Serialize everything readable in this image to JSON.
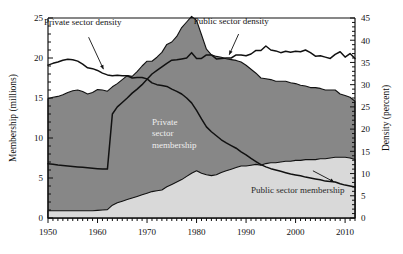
{
  "chart_data": {
    "type": "area",
    "title": "",
    "xlabel": "",
    "ylabel": "Membership (millions)",
    "y2label": "Density (percent)",
    "xlim": [
      1950,
      2012
    ],
    "ylim": [
      0,
      25
    ],
    "y2lim": [
      0,
      45
    ],
    "grid": false,
    "legend_position": "inline-annotations",
    "x_ticks": [
      1950,
      1960,
      1970,
      1980,
      1990,
      2000,
      2010
    ],
    "y_ticks": [
      0,
      5,
      10,
      15,
      20,
      25
    ],
    "y2_ticks": [
      0,
      5,
      10,
      15,
      20,
      25,
      30,
      35,
      40,
      45
    ],
    "x_minor_tick_step": 1,
    "y_minor_tick_step": 1,
    "annotations": [
      {
        "name": "private-sector-density-label",
        "text": "Private sector density",
        "x": 1957,
        "y": 24.1
      },
      {
        "name": "public-sector-density-label",
        "text": "Public sector density",
        "x": 1987,
        "y": 24.3
      },
      {
        "name": "private-sector-membership-label",
        "text": "Private",
        "x": 1971,
        "y": 11.6
      },
      {
        "name": "private-sector-membership-label-2",
        "text": "sector",
        "x": 1971,
        "y": 10.2
      },
      {
        "name": "private-sector-membership-label-3",
        "text": "membership",
        "x": 1971,
        "y": 8.8
      },
      {
        "name": "public-sector-membership-label",
        "text": "Public sector membership",
        "x": 1991,
        "y": 3.1
      }
    ],
    "x": [
      1950,
      1951,
      1952,
      1953,
      1954,
      1955,
      1956,
      1957,
      1958,
      1959,
      1960,
      1961,
      1962,
      1963,
      1964,
      1965,
      1966,
      1967,
      1968,
      1969,
      1970,
      1971,
      1972,
      1973,
      1974,
      1975,
      1976,
      1977,
      1978,
      1979,
      1980,
      1981,
      1982,
      1983,
      1984,
      1985,
      1986,
      1987,
      1988,
      1989,
      1990,
      1991,
      1992,
      1993,
      1994,
      1995,
      1996,
      1997,
      1998,
      1999,
      2000,
      2001,
      2002,
      2003,
      2004,
      2005,
      2006,
      2007,
      2008,
      2009,
      2010,
      2011,
      2012
    ],
    "series": [
      {
        "name": "Public sector membership",
        "axis": "left",
        "unit": "millions",
        "fill": "#d9d9d9",
        "values": [
          0.9,
          0.9,
          0.9,
          0.9,
          0.9,
          0.9,
          0.9,
          0.9,
          0.9,
          0.9,
          0.95,
          1.0,
          1.05,
          1.6,
          1.9,
          2.1,
          2.3,
          2.5,
          2.7,
          2.9,
          3.1,
          3.3,
          3.4,
          3.5,
          3.9,
          4.2,
          4.5,
          4.8,
          5.2,
          5.6,
          5.9,
          5.6,
          5.4,
          5.3,
          5.4,
          5.7,
          5.9,
          6.1,
          6.3,
          6.5,
          6.5,
          6.6,
          6.7,
          6.6,
          6.8,
          6.9,
          6.9,
          7.0,
          7.1,
          7.1,
          7.2,
          7.2,
          7.3,
          7.3,
          7.3,
          7.4,
          7.4,
          7.5,
          7.6,
          7.6,
          7.6,
          7.5,
          7.3
        ]
      },
      {
        "name": "Private sector membership",
        "axis": "left",
        "unit": "millions",
        "fill": "#878787",
        "values": [
          14.0,
          14.2,
          14.3,
          14.5,
          14.8,
          15.0,
          15.1,
          14.9,
          14.6,
          14.8,
          15.1,
          15.0,
          14.8,
          14.8,
          14.9,
          15.2,
          15.5,
          15.2,
          15.6,
          16.1,
          16.5,
          16.3,
          16.7,
          17.2,
          17.8,
          17.8,
          18.2,
          19.0,
          19.3,
          19.6,
          18.8,
          17.3,
          15.7,
          15.1,
          14.8,
          14.4,
          14.0,
          13.7,
          13.4,
          13.0,
          12.6,
          12.0,
          11.4,
          10.9,
          10.6,
          10.4,
          10.2,
          10.1,
          10.0,
          9.8,
          9.6,
          9.4,
          9.2,
          9.0,
          9.0,
          8.8,
          8.6,
          8.5,
          8.4,
          7.9,
          7.7,
          7.6,
          7.3
        ]
      },
      {
        "name": "Private sector density",
        "axis": "right",
        "unit": "percent",
        "stroke": "#111111",
        "values": [
          34.4,
          34.8,
          35.1,
          35.5,
          35.7,
          35.6,
          35.3,
          34.6,
          33.8,
          33.6,
          33.2,
          32.6,
          32.2,
          32.0,
          32.1,
          32.0,
          32.0,
          31.5,
          31.6,
          31.6,
          31.3,
          30.4,
          30.0,
          29.8,
          29.6,
          29.0,
          28.5,
          27.9,
          27.0,
          25.9,
          24.2,
          22.3,
          20.5,
          19.4,
          18.5,
          17.6,
          16.9,
          16.3,
          15.7,
          14.9,
          14.2,
          13.4,
          12.7,
          12.0,
          11.5,
          11.1,
          10.8,
          10.5,
          10.2,
          9.9,
          9.7,
          9.5,
          9.2,
          9.0,
          8.8,
          8.6,
          8.3,
          8.2,
          8.1,
          7.7,
          7.4,
          7.2,
          7.0
        ]
      },
      {
        "name": "Public sector density",
        "axis": "right",
        "unit": "percent",
        "stroke": "#111111",
        "values": [
          12.2,
          12.1,
          11.9,
          11.8,
          11.7,
          11.6,
          11.5,
          11.4,
          11.3,
          11.2,
          11.1,
          11.0,
          11.0,
          23.4,
          25.0,
          26.0,
          27.0,
          28.1,
          29.0,
          30.0,
          31.2,
          32.4,
          33.2,
          34.0,
          34.8,
          35.5,
          35.6,
          35.8,
          36.0,
          37.2,
          35.9,
          35.9,
          36.7,
          36.7,
          35.8,
          35.9,
          36.0,
          36.0,
          36.7,
          36.7,
          36.5,
          36.9,
          37.7,
          37.7,
          38.7,
          37.8,
          37.6,
          37.2,
          37.5,
          37.3,
          37.5,
          37.4,
          37.8,
          37.2,
          36.4,
          36.5,
          36.2,
          35.9,
          36.8,
          37.4,
          36.2,
          37.0,
          35.9
        ]
      }
    ]
  },
  "axes": {
    "left_title": "Membership (millions)",
    "right_title": "Density (percent)",
    "x_tick_labels": [
      "1950",
      "1960",
      "1970",
      "1980",
      "1990",
      "2000",
      "2010"
    ],
    "y_tick_labels": [
      "0",
      "5",
      "10",
      "15",
      "20",
      "25"
    ],
    "y2_tick_labels": [
      "0",
      "5",
      "10",
      "15",
      "20",
      "25",
      "30",
      "35",
      "40",
      "45"
    ]
  },
  "colors": {
    "private_membership_fill": "#878787",
    "public_membership_fill": "#d9d9d9",
    "line": "#111111",
    "background": "#ffffff",
    "plot_border": "#555555"
  }
}
